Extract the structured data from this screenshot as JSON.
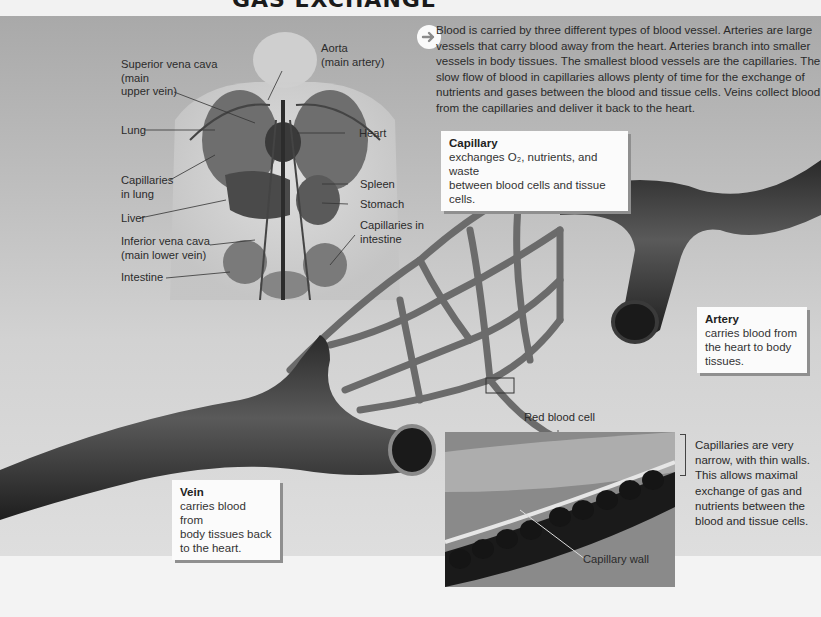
{
  "page": {
    "title": "GAS EXCHANGE"
  },
  "intro": {
    "icon": "arrow-right-circle-icon",
    "text": "Blood is carried by three different types of blood vessel. Arteries are large vessels that carry blood away from the heart. Arteries branch into smaller vessels in body tissues. The smallest blood vessels are the capillaries. The slow flow of blood in capillaries allows plenty of time for the exchange of nutrients and gases between the blood and tissue cells. Veins collect blood from the capillaries and deliver it back to the heart."
  },
  "body_diagram": {
    "labels": {
      "superior_vena_cava_1": "Superior vena cava",
      "superior_vena_cava_2": "(main",
      "superior_vena_cava_3": "upper vein)",
      "aorta_1": "Aorta",
      "aorta_2": "(main artery)",
      "lung": "Lung",
      "heart": "Heart",
      "capillaries_lung_1": "Capillaries",
      "capillaries_lung_2": "in lung",
      "spleen": "Spleen",
      "stomach": "Stomach",
      "liver": "Liver",
      "capillaries_intestine_1": "Capillaries in",
      "capillaries_intestine_2": "intestine",
      "inferior_vena_cava_1": "Inferior vena cava",
      "inferior_vena_cava_2": "(main lower vein)",
      "intestine": "Intestine"
    }
  },
  "callouts": {
    "capillary": {
      "title": "Capillary",
      "line1": "exchanges O₂, nutrients, and waste",
      "line2": "between blood cells and tissue cells."
    },
    "artery": {
      "title": "Artery",
      "line1": "carries blood from",
      "line2": "the heart to body",
      "line3": "tissues."
    },
    "vein": {
      "title": "Vein",
      "line1": "carries blood from",
      "line2": "body tissues back",
      "line3": "to the heart."
    }
  },
  "micrograph": {
    "red_blood_cell_label": "Red blood cell",
    "capillary_wall_label": "Capillary wall",
    "side_note": "Capillaries are very narrow, with thin walls. This allows maximal exchange of gas and nutrients between the blood and tissue cells."
  }
}
